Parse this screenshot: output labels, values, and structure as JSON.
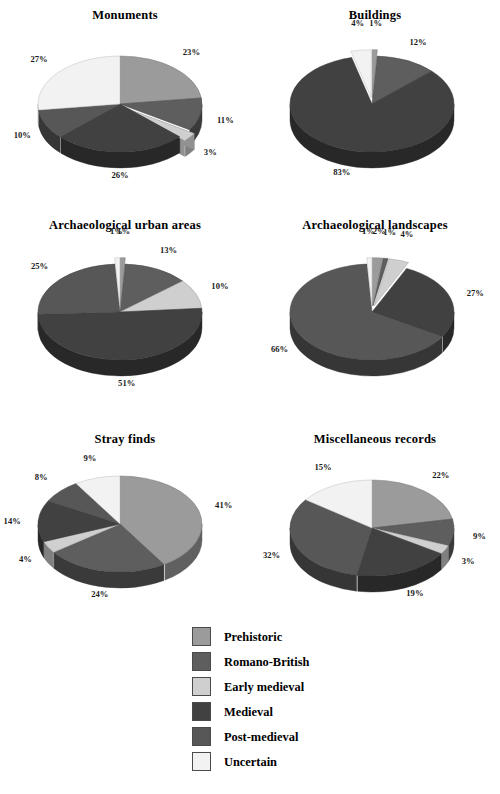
{
  "figure": {
    "caption": ""
  },
  "legend": {
    "items": [
      {
        "label": "Prehistoric",
        "color": "#9b9b9b"
      },
      {
        "label": "Romano-British",
        "color": "#5e5e5e"
      },
      {
        "label": "Early medieval",
        "color": "#cfcfcf"
      },
      {
        "label": "Medieval",
        "color": "#414141"
      },
      {
        "label": "Post-medieval",
        "color": "#575757"
      },
      {
        "label": "Uncertain",
        "color": "#f2f2f2"
      }
    ]
  },
  "chart_data": [
    {
      "type": "pie",
      "title": "Monuments",
      "categories": [
        "Prehistoric",
        "Romano-British",
        "Early medieval",
        "Medieval",
        "Post-medieval",
        "Uncertain"
      ],
      "values": [
        23,
        11,
        3,
        26,
        10,
        27
      ],
      "labels": [
        "23%",
        "11%",
        "3%",
        "26%",
        "10%",
        "27%"
      ],
      "exploded": [
        false,
        false,
        true,
        false,
        false,
        false
      ]
    },
    {
      "type": "pie",
      "title": "Buildings",
      "categories": [
        "Prehistoric",
        "Romano-British",
        "Early medieval",
        "Medieval",
        "Post-medieval",
        "Uncertain"
      ],
      "values": [
        1,
        12,
        0,
        83,
        0,
        4
      ],
      "labels": [
        "1%",
        "12%",
        "",
        "83%",
        "",
        "4%"
      ],
      "exploded": [
        true,
        false,
        false,
        false,
        false,
        true
      ]
    },
    {
      "type": "pie",
      "title": "Archaeological urban areas",
      "categories": [
        "Prehistoric",
        "Romano-British",
        "Early medieval",
        "Medieval",
        "Post-medieval",
        "Uncertain"
      ],
      "values": [
        1,
        13,
        10,
        51,
        25,
        1
      ],
      "labels": [
        "1%",
        "13%",
        "10%",
        "51%",
        "25%",
        "1%"
      ],
      "exploded": [
        true,
        false,
        false,
        false,
        false,
        true
      ]
    },
    {
      "type": "pie",
      "title": "Archaeological landscapes",
      "categories": [
        "Prehistoric",
        "Romano-British",
        "Early medieval",
        "Medieval",
        "Post-medieval",
        "Uncertain"
      ],
      "values": [
        2,
        1,
        4,
        27,
        66,
        1
      ],
      "labels": [
        "2%",
        "1%",
        "4%",
        "27%",
        "66%",
        "1%"
      ],
      "exploded": [
        true,
        true,
        true,
        false,
        false,
        true
      ]
    },
    {
      "type": "pie",
      "title": "Stray finds",
      "categories": [
        "Prehistoric",
        "Romano-British",
        "Early medieval",
        "Medieval",
        "Post-medieval",
        "Uncertain"
      ],
      "values": [
        41,
        24,
        4,
        14,
        8,
        9
      ],
      "labels": [
        "41%",
        "24%",
        "4%",
        "14%",
        "8%",
        "9%"
      ],
      "exploded": [
        false,
        false,
        false,
        false,
        false,
        false
      ]
    },
    {
      "type": "pie",
      "title": "Miscellaneous records",
      "categories": [
        "Prehistoric",
        "Romano-British",
        "Early medieval",
        "Medieval",
        "Post-medieval",
        "Uncertain"
      ],
      "values": [
        22,
        9,
        3,
        19,
        32,
        15
      ],
      "labels": [
        "22%",
        "9%",
        "3%",
        "19%",
        "32%",
        "15%"
      ],
      "exploded": [
        false,
        false,
        false,
        false,
        false,
        false
      ]
    }
  ]
}
